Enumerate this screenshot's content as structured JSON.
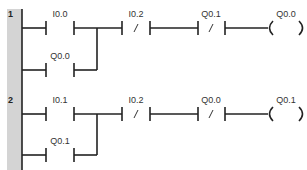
{
  "diagram": {
    "type": "ladder-logic",
    "rungs": [
      {
        "number": "1",
        "contacts": [
          {
            "address": "I0.0",
            "type": "normally-open",
            "branch": "main"
          },
          {
            "address": "Q0.0",
            "type": "normally-open",
            "branch": "parallel"
          },
          {
            "address": "I0.2",
            "type": "normally-closed",
            "branch": "main"
          },
          {
            "address": "Q0.1",
            "type": "normally-closed",
            "branch": "main"
          }
        ],
        "coil": {
          "address": "Q0.0",
          "type": "output"
        }
      },
      {
        "number": "2",
        "contacts": [
          {
            "address": "I0.1",
            "type": "normally-open",
            "branch": "main"
          },
          {
            "address": "Q0.1",
            "type": "normally-open",
            "branch": "parallel"
          },
          {
            "address": "I0.2",
            "type": "normally-closed",
            "branch": "main"
          },
          {
            "address": "Q0.0",
            "type": "normally-closed",
            "branch": "main"
          }
        ],
        "coil": {
          "address": "Q0.1",
          "type": "output"
        }
      }
    ],
    "nc_symbol": "/",
    "colors": {
      "line": "#222222",
      "rail": "#d4d4d4",
      "label": "#333333"
    }
  }
}
